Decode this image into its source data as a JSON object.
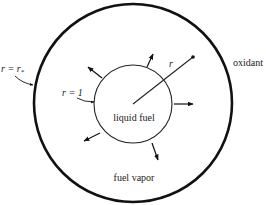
{
  "diagram": {
    "labels": {
      "outer_boundary": "r = r",
      "outer_boundary_subscript": "*",
      "inner_boundary": "r = 1",
      "radius": "r",
      "oxidant": "oxidant",
      "liquid_fuel": "liquid fuel",
      "fuel_vapor": "fuel vapor"
    },
    "geometry": {
      "center": [
        133,
        104
      ],
      "outer_radius": 99,
      "inner_radius": 39
    },
    "colors": {
      "stroke": "#111111",
      "background": "#ffffff"
    }
  }
}
